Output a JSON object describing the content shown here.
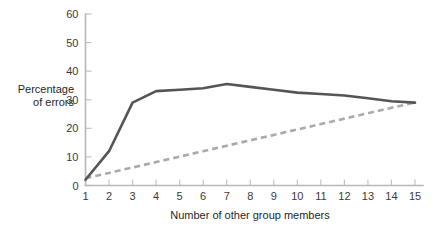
{
  "chart_data": {
    "type": "line",
    "title": "",
    "xlabel": "Number of other group members",
    "ylabel_line1": "Percentage",
    "ylabel_line2": "of errors",
    "ylabel": "Percentage of errors",
    "x": [
      1,
      2,
      3,
      4,
      5,
      6,
      7,
      8,
      9,
      10,
      11,
      12,
      13,
      14,
      15
    ],
    "xticklabels": [
      "1",
      "2",
      "3",
      "4",
      "5",
      "6",
      "7",
      "8",
      "9",
      "10",
      "11",
      "12",
      "13",
      "14",
      "15"
    ],
    "yticklabels": [
      "0",
      "10",
      "20",
      "30",
      "40",
      "50",
      "60"
    ],
    "yticks": [
      0,
      10,
      20,
      30,
      40,
      50,
      60
    ],
    "xlim": [
      1,
      15
    ],
    "ylim": [
      0,
      60
    ],
    "grid": false,
    "legend": false,
    "legend_position": "none",
    "series": [
      {
        "name": "Observed errors",
        "style": "solid",
        "color": "#555555",
        "values": [
          2,
          12,
          29,
          33,
          33.5,
          34,
          35.5,
          34.5,
          33.5,
          32.5,
          32,
          31.5,
          30.5,
          29.5,
          29
        ]
      },
      {
        "name": "Predicted errors",
        "style": "dashed",
        "color": "#aaaaaa",
        "values": [
          2.5,
          4.4,
          6.3,
          8.2,
          10.1,
          12,
          13.9,
          15.8,
          17.7,
          19.6,
          21.5,
          23.4,
          25.3,
          27.2,
          29
        ]
      }
    ],
    "axis_color": "#b8b8b8",
    "tick_color": "#c4c4c4",
    "text_color": "#1f1f1f"
  }
}
